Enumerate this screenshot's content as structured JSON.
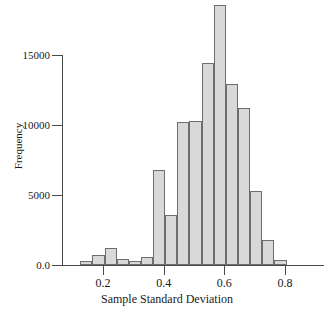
{
  "chart_data": {
    "type": "bar",
    "title": "",
    "xlabel": "Sample Standard Deviation",
    "ylabel": "Frequency",
    "xlim": [
      0.09,
      0.92
    ],
    "ylim": [
      0,
      18800
    ],
    "grid": false,
    "legend": null,
    "bin_width": 0.04,
    "bar_color": "#d9d9d9",
    "bar_edge_color": "#6e6e6e",
    "x_tick_labels": [
      "0.2",
      "0.4",
      "0.6",
      "0.8"
    ],
    "x_tick_values": [
      0.2,
      0.4,
      0.6,
      0.8
    ],
    "y_tick_labels": [
      "0.0",
      "5000",
      "10000",
      "15000"
    ],
    "y_tick_values": [
      0,
      5000,
      10000,
      15000
    ],
    "bins": [
      {
        "x0": 0.125,
        "x1": 0.165,
        "value": 300
      },
      {
        "x0": 0.165,
        "x1": 0.205,
        "value": 750
      },
      {
        "x0": 0.205,
        "x1": 0.245,
        "value": 1200
      },
      {
        "x0": 0.245,
        "x1": 0.285,
        "value": 400
      },
      {
        "x0": 0.285,
        "x1": 0.325,
        "value": 300
      },
      {
        "x0": 0.325,
        "x1": 0.365,
        "value": 600
      },
      {
        "x0": 0.365,
        "x1": 0.405,
        "value": 6800
      },
      {
        "x0": 0.405,
        "x1": 0.445,
        "value": 3600
      },
      {
        "x0": 0.445,
        "x1": 0.485,
        "value": 10200
      },
      {
        "x0": 0.485,
        "x1": 0.525,
        "value": 10300
      },
      {
        "x0": 0.525,
        "x1": 0.565,
        "value": 14400
      },
      {
        "x0": 0.565,
        "x1": 0.605,
        "value": 18600
      },
      {
        "x0": 0.605,
        "x1": 0.645,
        "value": 12900
      },
      {
        "x0": 0.645,
        "x1": 0.685,
        "value": 11250
      },
      {
        "x0": 0.685,
        "x1": 0.725,
        "value": 5300
      },
      {
        "x0": 0.725,
        "x1": 0.765,
        "value": 1800
      },
      {
        "x0": 0.765,
        "x1": 0.805,
        "value": 350
      }
    ]
  }
}
